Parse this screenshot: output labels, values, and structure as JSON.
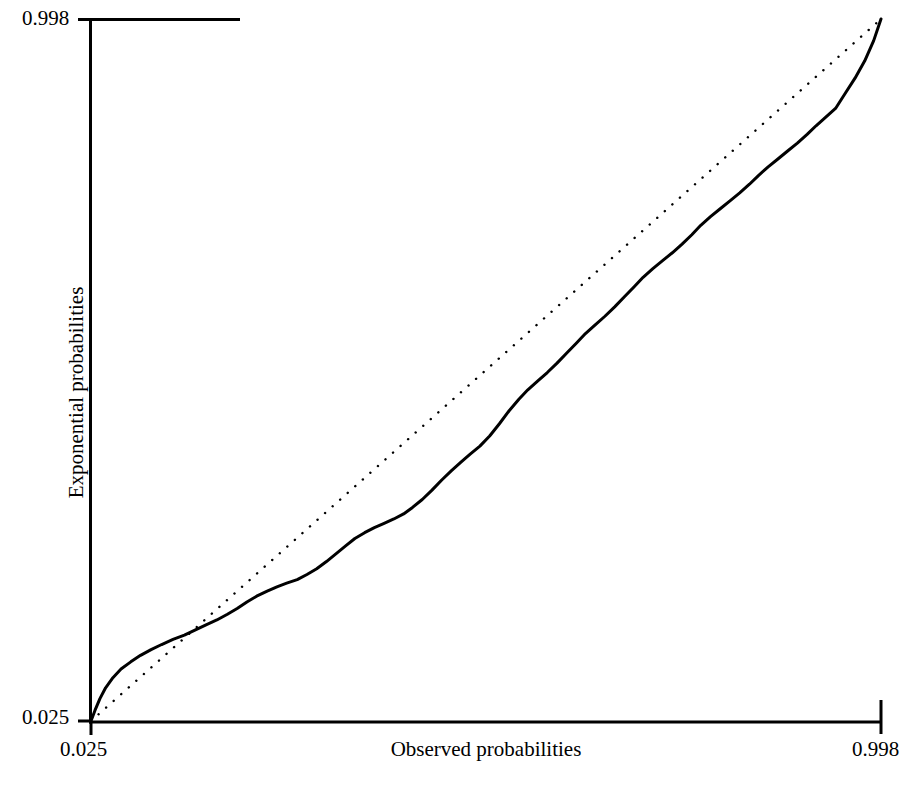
{
  "chart_data": {
    "type": "line",
    "title": "",
    "subtitle": "",
    "xlabel": "Observed probabilities",
    "ylabel": "Exponential probabilities",
    "xlim": [
      0.025,
      0.998
    ],
    "ylim": [
      0.025,
      0.998
    ],
    "xticks": [
      0.025,
      0.998
    ],
    "yticks": [
      0.025,
      0.998
    ],
    "xtick_labels": [
      "0.025",
      "0.998"
    ],
    "ytick_labels": [
      "0.025",
      "0.998"
    ],
    "grid": false,
    "legend": false,
    "legend_position": "none",
    "background_color": "#ffffff",
    "foreground_color": "#000000",
    "axis_color": "#000000",
    "series": [
      {
        "name": "Reference line",
        "style": "dotted",
        "color": "#000000",
        "linewidth": 2.4,
        "description": "1:1 diagonal reference from (0.025, 0.025) to (0.998, 0.998)",
        "x": [
          0.025,
          0.998
        ],
        "y": [
          0.025,
          0.998
        ]
      },
      {
        "name": "Empirical probability curve",
        "style": "solid",
        "color": "#000000",
        "linewidth": 3.0,
        "description": "Stepped empirical quantile curve; rises above the diagonal near the origin, dips below between about 0.12 and 0.52, crosses back above and converges with the diagonal at the upper right.",
        "x": [
          0.025,
          0.03,
          0.036,
          0.043,
          0.052,
          0.062,
          0.074,
          0.086,
          0.099,
          0.112,
          0.126,
          0.14,
          0.153,
          0.166,
          0.18,
          0.193,
          0.205,
          0.217,
          0.229,
          0.242,
          0.254,
          0.266,
          0.279,
          0.291,
          0.303,
          0.315,
          0.327,
          0.339,
          0.35,
          0.362,
          0.374,
          0.386,
          0.398,
          0.41,
          0.421,
          0.433,
          0.445,
          0.457,
          0.469,
          0.481,
          0.492,
          0.504,
          0.516,
          0.528,
          0.54,
          0.552,
          0.563,
          0.575,
          0.587,
          0.599,
          0.611,
          0.623,
          0.634,
          0.646,
          0.658,
          0.67,
          0.682,
          0.694,
          0.705,
          0.717,
          0.729,
          0.741,
          0.753,
          0.765,
          0.776,
          0.788,
          0.8,
          0.812,
          0.824,
          0.836,
          0.847,
          0.859,
          0.871,
          0.883,
          0.895,
          0.907,
          0.918,
          0.93,
          0.942,
          0.954,
          0.966,
          0.978,
          0.989,
          0.998
        ],
        "y": [
          0.025,
          0.04,
          0.056,
          0.071,
          0.085,
          0.097,
          0.107,
          0.116,
          0.124,
          0.131,
          0.138,
          0.144,
          0.151,
          0.158,
          0.165,
          0.173,
          0.181,
          0.19,
          0.198,
          0.205,
          0.211,
          0.216,
          0.221,
          0.228,
          0.236,
          0.246,
          0.257,
          0.268,
          0.278,
          0.286,
          0.293,
          0.299,
          0.305,
          0.312,
          0.321,
          0.332,
          0.345,
          0.359,
          0.372,
          0.384,
          0.395,
          0.406,
          0.42,
          0.437,
          0.455,
          0.471,
          0.484,
          0.496,
          0.508,
          0.521,
          0.535,
          0.549,
          0.562,
          0.574,
          0.586,
          0.599,
          0.613,
          0.627,
          0.64,
          0.652,
          0.663,
          0.674,
          0.686,
          0.699,
          0.712,
          0.724,
          0.735,
          0.746,
          0.757,
          0.769,
          0.781,
          0.793,
          0.804,
          0.815,
          0.826,
          0.838,
          0.85,
          0.862,
          0.874,
          0.895,
          0.916,
          0.94,
          0.968,
          0.998
        ]
      }
    ]
  },
  "axes": {
    "x_title": "Observed probabilities",
    "y_title": "Exponential probabilities",
    "x_min_label": "0.025",
    "x_max_label": "0.998",
    "y_min_label": "0.025",
    "y_max_label": "0.998"
  }
}
